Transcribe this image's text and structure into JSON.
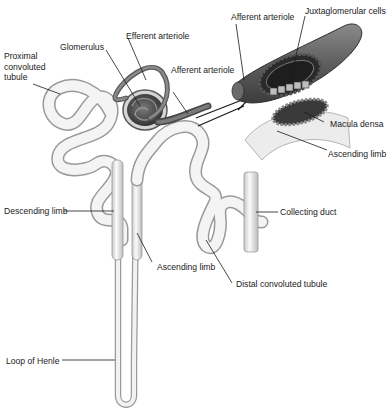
{
  "figure": {
    "colors": {
      "tubule_fill": "#eeeeee",
      "tubule_stroke": "#9a9a9a",
      "vessel_fill": "#6e6e6e",
      "vessel_dark": "#3a3a3a",
      "glomerulus": "#4d4d4d",
      "leader_line": "#1a1a1a",
      "background": "#ffffff"
    }
  },
  "labels": {
    "proximal": "Proximal\nconvoluted\ntubule",
    "glomerulus": "Glomerulus",
    "efferent": "Efferent arteriole",
    "afferent_main": "Afferent arteriole",
    "afferent_inset": "Afferent arteriole",
    "juxtaglomerular": "Juxtaglomerular cells",
    "macula_densa": "Macula densa",
    "ascending_inset": "Ascending limb",
    "descending": "Descending limb",
    "collecting": "Collecting duct",
    "ascending_main": "Ascending limb",
    "distal": "Distal convoluted tubule",
    "loop": "Loop of Henle"
  }
}
